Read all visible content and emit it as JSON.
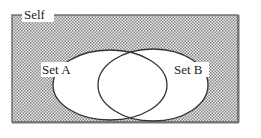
{
  "diagram": {
    "type": "venn",
    "universe": {
      "label": "Self"
    },
    "sets": [
      {
        "label": "Set A"
      },
      {
        "label": "Set B"
      }
    ],
    "colors": {
      "background_pattern": "#9a9a9a",
      "border": "#444444",
      "circle_fill": "#ffffff",
      "circle_stroke": "#333333"
    }
  }
}
